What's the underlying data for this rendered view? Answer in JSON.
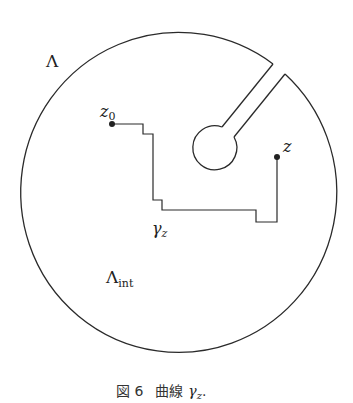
{
  "diagram": {
    "region_label": "Λ",
    "interior_label": "Λ",
    "interior_subscript": "int",
    "start_point_label": "z",
    "start_point_subscript": "0",
    "end_point_label": "z",
    "curve_label": "γ",
    "curve_subscript": "z"
  },
  "caption": {
    "figure_number": "図 6",
    "text": "曲線",
    "math": "γ",
    "math_subscript": "z",
    "trailing": "."
  },
  "colors": {
    "stroke": "#2a2a2a",
    "background": "#ffffff"
  }
}
